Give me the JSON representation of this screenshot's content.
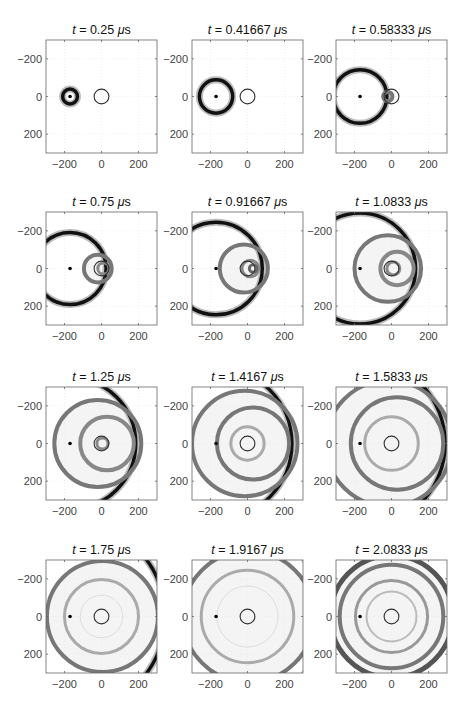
{
  "figure": {
    "title_prefix": "t = ",
    "unit": "μs"
  },
  "layout": {
    "col_left": [
      46,
      192,
      336
    ],
    "row_top": [
      40,
      212,
      387,
      560
    ],
    "axes_w": 111,
    "axes_h": 113
  },
  "chart_data": {
    "type": "heatmap",
    "xlim": [
      -300,
      300
    ],
    "ylim": [
      -300,
      300
    ],
    "y_reversed": true,
    "xticks": [
      -200,
      0,
      200
    ],
    "yticks": [
      -200,
      0,
      200
    ],
    "xtick_labels": [
      "−200",
      "0",
      "200"
    ],
    "ytick_labels": [
      "−200",
      "0",
      "200"
    ],
    "grid": true,
    "source": {
      "x": -170,
      "y": 0
    },
    "scatterer": {
      "x": 0,
      "y": 0,
      "r": 40
    },
    "panels": [
      {
        "t": "0.25",
        "title": "t = 0.25 μs",
        "incident_r": 40,
        "rings": []
      },
      {
        "t": "0.41667",
        "title": "t = 0.41667 μs",
        "incident_r": 90,
        "rings": []
      },
      {
        "t": "0.58333",
        "title": "t = 0.58333 μs",
        "incident_r": 145,
        "rings": [
          {
            "cx": -20,
            "r": 25,
            "w": 4,
            "c": "#777"
          }
        ]
      },
      {
        "t": "0.75",
        "title": "t = 0.75 μs",
        "incident_r": 195,
        "rings": [
          {
            "cx": -20,
            "r": 75,
            "w": 4,
            "c": "#777"
          },
          {
            "cx": 10,
            "r": 30,
            "w": 3,
            "c": "#888"
          }
        ]
      },
      {
        "t": "0.91667",
        "title": "t = 0.91667 μs",
        "incident_r": 250,
        "rings": [
          {
            "cx": -20,
            "r": 130,
            "w": 4,
            "c": "#777"
          },
          {
            "cx": 15,
            "r": 45,
            "w": 3,
            "c": "#888"
          },
          {
            "cx": 30,
            "r": 20,
            "w": 3,
            "c": "#666"
          }
        ]
      },
      {
        "t": "1.0833",
        "title": "t = 1.0833 μs",
        "incident_r": 300,
        "rings": [
          {
            "cx": -20,
            "r": 180,
            "w": 4,
            "c": "#777"
          },
          {
            "cx": 30,
            "r": 90,
            "w": 4,
            "c": "#888"
          },
          {
            "cx": 10,
            "r": 35,
            "w": 3,
            "c": "#888"
          }
        ]
      },
      {
        "t": "1.25",
        "title": "t = 1.25 μs",
        "incident_r": 355,
        "rings": [
          {
            "cx": -20,
            "r": 235,
            "w": 4,
            "c": "#777"
          },
          {
            "cx": 30,
            "r": 145,
            "w": 4,
            "c": "#888"
          },
          {
            "cx": 5,
            "r": 30,
            "w": 3,
            "c": "#888"
          }
        ]
      },
      {
        "t": "1.4167",
        "title": "t = 1.4167 μs",
        "incident_r": 410,
        "rings": [
          {
            "cx": -15,
            "r": 285,
            "w": 4,
            "c": "#777"
          },
          {
            "cx": 30,
            "r": 195,
            "w": 4,
            "c": "#777"
          },
          {
            "cx": 0,
            "r": 90,
            "w": 3,
            "c": "#aaa"
          }
        ]
      },
      {
        "t": "1.5833",
        "title": "t = 1.5833 μs",
        "incident_r": 460,
        "rings": [
          {
            "cx": -15,
            "r": 340,
            "w": 4,
            "c": "#777"
          },
          {
            "cx": 30,
            "r": 250,
            "w": 4,
            "c": "#777"
          },
          {
            "cx": 0,
            "r": 145,
            "w": 3,
            "c": "#aaa"
          }
        ]
      },
      {
        "t": "1.75",
        "title": "t = 1.75 μs",
        "incident_r": 515,
        "rings": [
          {
            "cx": 5,
            "r": 300,
            "w": 4,
            "c": "#777"
          },
          {
            "cx": 0,
            "r": 200,
            "w": 3,
            "c": "#aaa"
          },
          {
            "cx": 0,
            "r": 115,
            "w": 1,
            "c": "#ddd"
          }
        ]
      },
      {
        "t": "1.9167",
        "title": "t = 1.9167 μs",
        "incident_r": 570,
        "rings": [
          {
            "cx": 5,
            "r": 355,
            "w": 4,
            "c": "#777"
          },
          {
            "cx": 0,
            "r": 250,
            "w": 3,
            "c": "#aaa"
          },
          {
            "cx": 0,
            "r": 165,
            "w": 1,
            "c": "#ddd"
          }
        ]
      },
      {
        "t": "2.0833",
        "title": "t = 2.0833 μs",
        "incident_r": 620,
        "rings": [
          {
            "cx": 0,
            "r": 330,
            "w": 5,
            "c": "#555"
          },
          {
            "cx": 0,
            "r": 280,
            "w": 4,
            "c": "#777"
          },
          {
            "cx": 0,
            "r": 195,
            "w": 3,
            "c": "#999"
          },
          {
            "cx": 0,
            "r": 135,
            "w": 2,
            "c": "#bbb"
          }
        ]
      }
    ]
  }
}
